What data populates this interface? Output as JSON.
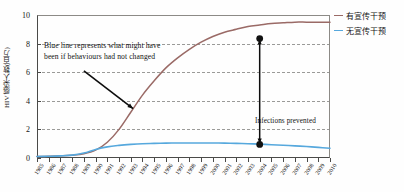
{
  "chart_data": {
    "type": "line",
    "title": "",
    "xlabel": "",
    "ylabel": "HIV 感染人数(百万)",
    "xlim": [
      1985,
      2010
    ],
    "ylim": [
      0,
      10
    ],
    "grid": true,
    "y_ticks": [
      0,
      2,
      4,
      6,
      8,
      10
    ],
    "y_tick_labels": [
      "0",
      "2",
      "4",
      "6",
      "8",
      "10"
    ],
    "x": [
      1985,
      1986,
      1987,
      1988,
      1989,
      1990,
      1991,
      1992,
      1993,
      1994,
      1995,
      1996,
      1997,
      1998,
      1999,
      2000,
      2001,
      2002,
      2003,
      2004,
      2005,
      2006,
      2007,
      2008,
      2009,
      2010
    ],
    "x_tick_labels": [
      "1985",
      "1986",
      "1987",
      "1988",
      "1989",
      "1990",
      "1991",
      "1992",
      "1993",
      "1994",
      "1995",
      "1996",
      "1997",
      "1998",
      "1999",
      "2000",
      "2001",
      "2002",
      "2003",
      "2004",
      "2005",
      "2006",
      "2007",
      "2008",
      "2009",
      "2010"
    ],
    "legend_position": "right",
    "series": [
      {
        "name": "无宣传干预",
        "color": "#9a6a66",
        "values": [
          0.1,
          0.12,
          0.15,
          0.2,
          0.3,
          0.55,
          1.1,
          2.0,
          3.2,
          4.4,
          5.4,
          6.3,
          7.0,
          7.6,
          8.1,
          8.5,
          8.8,
          9.0,
          9.2,
          9.3,
          9.4,
          9.45,
          9.5,
          9.5,
          9.5,
          9.5
        ]
      },
      {
        "name": "有宣传干预",
        "color": "#56a8dd",
        "values": [
          0.1,
          0.12,
          0.15,
          0.2,
          0.35,
          0.6,
          0.78,
          0.88,
          0.95,
          1.0,
          1.02,
          1.04,
          1.05,
          1.05,
          1.05,
          1.05,
          1.04,
          1.02,
          1.0,
          0.97,
          0.93,
          0.89,
          0.85,
          0.8,
          0.74,
          0.68
        ]
      }
    ],
    "annotations": [
      {
        "id": "blue-line-note",
        "line1": "Blue line represents what might have",
        "line2": "been if behaviours had not changed",
        "leader_from": [
          1989.0,
          6.1
        ],
        "leader_to": [
          1993.2,
          3.45
        ]
      },
      {
        "id": "infections-prevented",
        "text": "Infections prevented",
        "arrow_x": 2004,
        "arrow_top_value": 8.35,
        "arrow_bottom_value": 0.95
      }
    ],
    "markers": [
      {
        "x": 2004,
        "y": 8.35,
        "color": "#111111"
      },
      {
        "x": 2004,
        "y": 0.95,
        "color": "#111111"
      }
    ]
  },
  "legend": {
    "items": [
      {
        "label": "有宣传干预",
        "color": "#9a6a66"
      },
      {
        "label": "无宣传干预",
        "color": "#56a8dd"
      }
    ]
  },
  "axes": {
    "y_title": "HIV 感染人数(百万)"
  }
}
